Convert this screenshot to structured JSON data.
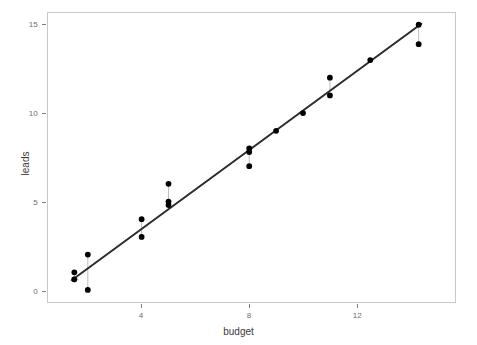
{
  "chart_data": {
    "type": "scatter",
    "title": "",
    "xlabel": "budget",
    "ylabel": "leads",
    "xlim": [
      0.52,
      15.65
    ],
    "ylim": [
      -0.68,
      15.66
    ],
    "xticks": [
      4,
      8,
      12
    ],
    "yticks": [
      0,
      5,
      10,
      15
    ],
    "grid": false,
    "legend": null,
    "series": [
      {
        "name": "observations",
        "marker": "filled-circle",
        "color": "#000000",
        "points": [
          {
            "x": 1.5,
            "y": 1.0
          },
          {
            "x": 1.5,
            "y": 0.6
          },
          {
            "x": 2.0,
            "y": 2.0
          },
          {
            "x": 2.0,
            "y": 0.0
          },
          {
            "x": 4.0,
            "y": 4.0
          },
          {
            "x": 4.0,
            "y": 3.0
          },
          {
            "x": 5.0,
            "y": 6.0
          },
          {
            "x": 5.0,
            "y": 5.0
          },
          {
            "x": 5.0,
            "y": 4.8
          },
          {
            "x": 8.0,
            "y": 8.0
          },
          {
            "x": 8.0,
            "y": 7.8
          },
          {
            "x": 8.0,
            "y": 7.0
          },
          {
            "x": 9.0,
            "y": 9.0
          },
          {
            "x": 10.0,
            "y": 10.0
          },
          {
            "x": 11.0,
            "y": 12.0
          },
          {
            "x": 11.0,
            "y": 11.0
          },
          {
            "x": 12.5,
            "y": 13.0
          },
          {
            "x": 14.3,
            "y": 15.0
          },
          {
            "x": 14.3,
            "y": 13.9
          }
        ]
      }
    ],
    "fit_line": {
      "name": "regression-line",
      "color": "#2b2b2b",
      "width": 2,
      "x_start": 1.4,
      "y_start": 0.55,
      "x_end": 14.4,
      "y_end": 15.05
    },
    "residual_segments": [
      {
        "x": 1.5,
        "y_point": 1.0,
        "y_fit": 0.66
      },
      {
        "x": 2.0,
        "y_point": 0.0,
        "y_fit": 1.22
      },
      {
        "x": 2.0,
        "y_point": 2.0,
        "y_fit": 1.22
      },
      {
        "x": 4.0,
        "y_point": 3.0,
        "y_fit": 3.45
      },
      {
        "x": 4.0,
        "y_point": 4.0,
        "y_fit": 3.45
      },
      {
        "x": 5.0,
        "y_point": 6.0,
        "y_fit": 4.56
      },
      {
        "x": 5.0,
        "y_point": 5.0,
        "y_fit": 4.56
      },
      {
        "x": 8.0,
        "y_point": 7.0,
        "y_fit": 7.9
      },
      {
        "x": 8.0,
        "y_point": 8.0,
        "y_fit": 7.9
      },
      {
        "x": 11.0,
        "y_point": 12.0,
        "y_fit": 11.24
      },
      {
        "x": 14.3,
        "y_point": 13.9,
        "y_fit": 14.92
      }
    ],
    "open_marker": {
      "x": 1.5,
      "y": 0.6
    }
  },
  "axes": {
    "x_tick_labels": [
      "4",
      "8",
      "12"
    ],
    "y_tick_labels": [
      "0",
      "5",
      "10",
      "15"
    ],
    "x_title": "budget",
    "y_title": "leads"
  },
  "style": {
    "panel_border": "#c9c9c9",
    "tick_color": "#7f7f7f",
    "label_color": "#6e6e6e",
    "title_color": "#3a3a3a",
    "point_color": "#000000",
    "line_color": "#2b2b2b",
    "residual_color": "#bdbdbd",
    "background": "#ffffff"
  }
}
